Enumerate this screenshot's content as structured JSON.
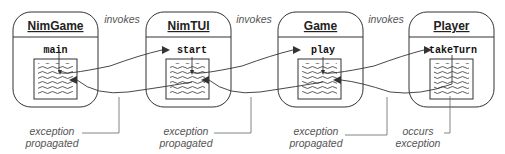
{
  "diagram": {
    "classes": [
      {
        "name": "NimGame",
        "method": "main"
      },
      {
        "name": "NimTUI",
        "method": "start"
      },
      {
        "name": "Game",
        "method": "play"
      },
      {
        "name": "Player",
        "method": "takeTurn"
      }
    ],
    "invoke_labels": [
      "invokes",
      "invokes",
      "invokes"
    ],
    "annotations": [
      {
        "line1": "exception",
        "line2": "propagated"
      },
      {
        "line1": "exception",
        "line2": "propagated"
      },
      {
        "line1": "exception",
        "line2": "propagated"
      },
      {
        "line1": "occurs",
        "line2": "exception"
      }
    ],
    "colors": {
      "stroke": "#333333",
      "label": "#555555",
      "background": "#ffffff"
    }
  }
}
